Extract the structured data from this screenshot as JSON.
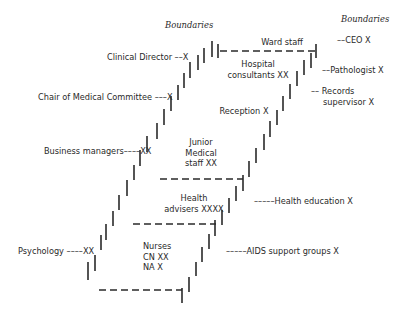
{
  "diagram": {
    "headers": {
      "left": "Boundaries",
      "right": "Boundaries"
    },
    "inner_labels": [
      {
        "id": "ward-staff",
        "lines": [
          "Ward staff"
        ]
      },
      {
        "id": "hospital-consultants",
        "lines": [
          "Hospital",
          "consultants XX"
        ]
      },
      {
        "id": "reception",
        "lines": [
          "Reception X"
        ]
      },
      {
        "id": "junior-medical-staff",
        "lines": [
          "Junior",
          "Medical",
          "staff XX"
        ]
      },
      {
        "id": "health-advisers",
        "lines": [
          "Health",
          "advisers XXXX"
        ]
      },
      {
        "id": "nurses",
        "lines": [
          "Nurses",
          "CN XX",
          "NA X"
        ]
      }
    ],
    "left_labels": [
      {
        "id": "clinical-director",
        "text": "Clinical Director ––X"
      },
      {
        "id": "chair-medical-committee",
        "text": "Chair of Medical Committee –––X"
      },
      {
        "id": "business-managers",
        "text": "Business managers––––XX"
      },
      {
        "id": "psychology",
        "text": "Psychology ––––XX"
      }
    ],
    "right_labels": [
      {
        "id": "ceo",
        "lines": [
          "––CEO X"
        ]
      },
      {
        "id": "pathologist",
        "lines": [
          "––Pathologist X"
        ]
      },
      {
        "id": "records-supervisor",
        "lines": [
          "–– Records",
          "supervisor X"
        ]
      },
      {
        "id": "health-education",
        "lines": [
          "–––––Health education X"
        ]
      },
      {
        "id": "aids-support-groups",
        "lines": [
          "–––––AIDS support groups X"
        ]
      }
    ],
    "colors": {
      "ink": "#2a2a2a",
      "background": "#ffffff"
    }
  }
}
